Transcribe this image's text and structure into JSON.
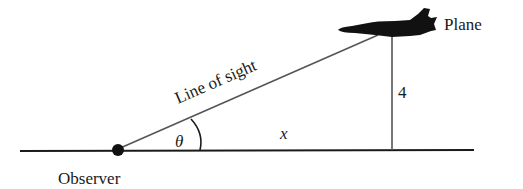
{
  "diagram": {
    "labels": {
      "plane": "Plane",
      "line_of_sight": "Line of sight",
      "height": "4",
      "angle": "θ",
      "horizontal": "x",
      "observer": "Observer"
    },
    "colors": {
      "ground": "#1a1a1a",
      "lines": "#555555",
      "plane": "#111111",
      "text": "#1a1a1a"
    }
  }
}
